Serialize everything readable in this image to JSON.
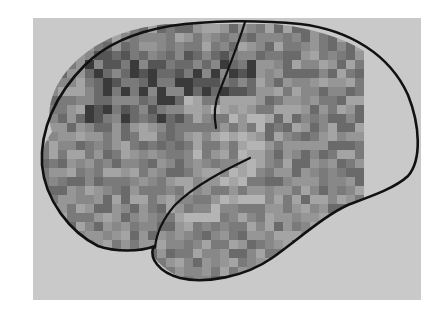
{
  "figure": {
    "background_color": "#ffffff",
    "panel_color": "#c9c9c9",
    "outline_color": "#111111",
    "block_size": 9,
    "texture_region": {
      "x0": 40,
      "y0": 24,
      "x1": 358,
      "y1": 262
    },
    "gray_levels": [
      "#3a3a3a",
      "#555555",
      "#6a6a6a",
      "#7a7a7a",
      "#888888",
      "#969696",
      "#a4a4a4",
      "#b4b4b4",
      "#c6c6c6"
    ],
    "landmarks": [
      "brain-outline",
      "central-sulcus",
      "sylvian-fissure",
      "temporal-lobe"
    ]
  }
}
